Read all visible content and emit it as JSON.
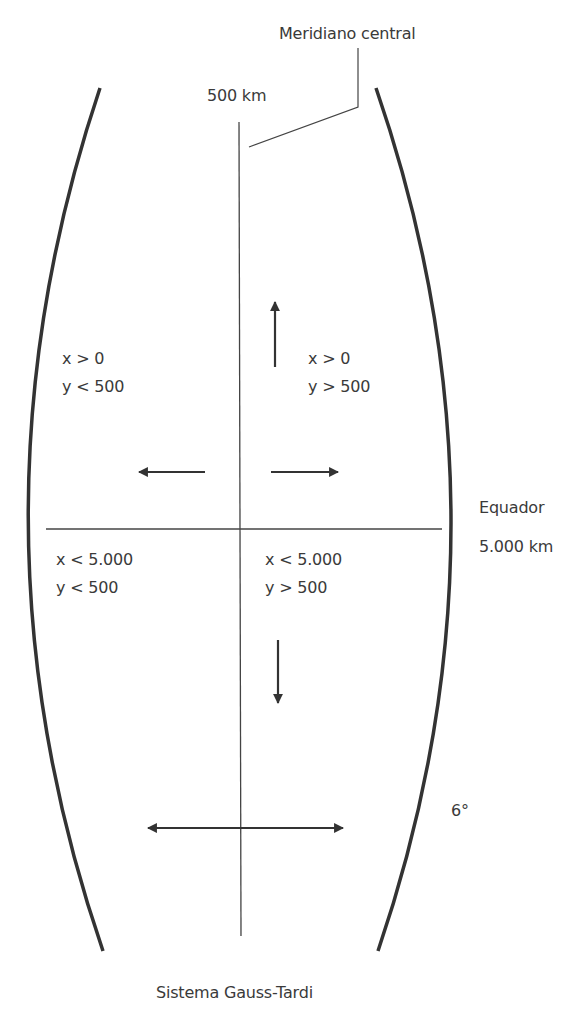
{
  "diagram": {
    "title": "Sistema Gauss-Tardi",
    "colors": {
      "boundary": "#333333",
      "lines": "#444444",
      "arrows": "#333333",
      "text": "#3a3a3a",
      "background": "#ffffff"
    },
    "labels": {
      "central_meridian": "Meridiano central",
      "meridian_value": "500 km",
      "equator": "Equador",
      "equator_value": "5.000 km",
      "zone_width": "6°"
    },
    "quadrants": {
      "top_left": {
        "x": "x > 0",
        "y": "y < 500"
      },
      "top_right": {
        "x": "x > 0",
        "y": "y > 500"
      },
      "bottom_left": {
        "x": "x < 5.000",
        "y": "y < 500"
      },
      "bottom_right": {
        "x": "x < 5.000",
        "y": "y > 500"
      }
    },
    "arrows": [
      {
        "name": "arrow-up",
        "direction": "up"
      },
      {
        "name": "arrow-left",
        "direction": "left"
      },
      {
        "name": "arrow-right",
        "direction": "right"
      },
      {
        "name": "arrow-down",
        "direction": "down"
      },
      {
        "name": "arrow-double-horizontal",
        "direction": "left-right"
      }
    ]
  }
}
